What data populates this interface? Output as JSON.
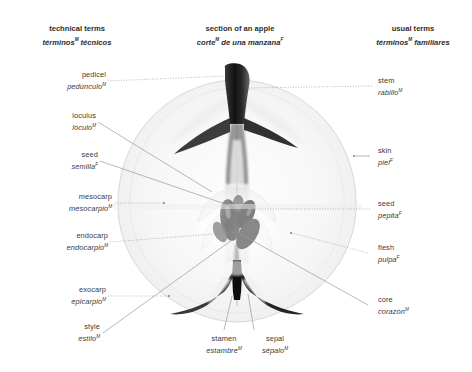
{
  "figure": {
    "title": {
      "en": "section of an apple",
      "es": "corte",
      "es_sup1": "M",
      "es_rest": " de una manzana",
      "es_sup2": "F"
    },
    "column_headers": {
      "left": {
        "en": "technical terms",
        "es": "términos",
        "es_sup": "M",
        "es_rest": " técnicos"
      },
      "right": {
        "en": "usual terms",
        "es": "términos",
        "es_sup": "M",
        "es_rest": " familiares"
      }
    }
  },
  "labels": {
    "left": [
      {
        "en": "pedicel",
        "es": "pedúnculo",
        "gender": "M"
      },
      {
        "en": "loculus",
        "es": "lóculo",
        "gender": "M"
      },
      {
        "en": "seed",
        "es": "semilla",
        "gender": "F"
      },
      {
        "en": "mesocarp",
        "es": "mesocarpio",
        "gender": "M"
      },
      {
        "en": "endocarp",
        "es": "endocarpio",
        "gender": "M"
      },
      {
        "en": "exocarp",
        "es": "epicarpio",
        "gender": "M"
      },
      {
        "en": "style",
        "es": "estilo",
        "gender": "M"
      }
    ],
    "right": [
      {
        "en": "stem",
        "es": "rabillo",
        "gender": "M"
      },
      {
        "en": "skin",
        "es": "piel",
        "gender": "F"
      },
      {
        "en": "seed",
        "es": "pepita",
        "gender": "F"
      },
      {
        "en": "flesh",
        "es": "pulpa",
        "gender": "F"
      },
      {
        "en": "core",
        "es": "corazón",
        "gender": "M"
      }
    ],
    "bottom": [
      {
        "en": "stamen",
        "es": "estambre",
        "gender": "M"
      },
      {
        "en": "sepal",
        "es": "sépalo",
        "gender": "M"
      }
    ]
  },
  "illustration": {
    "subject": "apple-cross-section",
    "style": "grayscale-photograph",
    "background": "#ffffff",
    "leader_line_color": "#9a9a9a"
  }
}
